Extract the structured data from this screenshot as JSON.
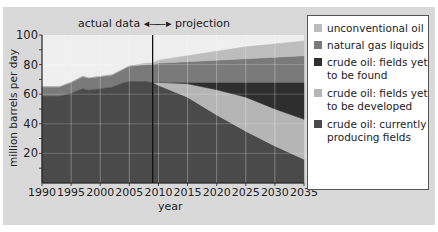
{
  "header": {
    "actual_label": "actual data",
    "projection_label": "projection"
  },
  "axes": {
    "ylabel": "million barrels per day",
    "xlabel": "year",
    "yticks": [
      "20",
      "40",
      "60",
      "80",
      "100"
    ],
    "xticks": [
      "1990",
      "1995",
      "2000",
      "2005",
      "2010",
      "2015",
      "2020",
      "2025",
      "2030",
      "2035"
    ]
  },
  "legend": {
    "items": [
      {
        "label1": "unconventional oil",
        "label2": "",
        "color": "#bdbdbd"
      },
      {
        "label1": "natural gas liquids",
        "label2": "",
        "color": "#7a7a7a"
      },
      {
        "label1": "crude oil: fields yet",
        "label2": "to be found",
        "color": "#2e2e2e"
      },
      {
        "label1": "crude oil: fields yet",
        "label2": "to be developed",
        "color": "#b5b5b5"
      },
      {
        "label1": "crude oil: currently",
        "label2": "producing fields",
        "color": "#4a4a4a"
      }
    ]
  },
  "chart_data": {
    "type": "area",
    "stacked": true,
    "title": "",
    "xlabel": "year",
    "ylabel": "million barrels per day",
    "xlim": [
      1990,
      2035
    ],
    "ylim": [
      0,
      100
    ],
    "grid": true,
    "divider_year": 2009,
    "annotations": [
      "actual data",
      "projection"
    ],
    "legend_position": "right",
    "x": [
      1990,
      1993,
      1995,
      1997,
      1998,
      2000,
      2002,
      2004,
      2005,
      2008,
      2009,
      2010,
      2015,
      2020,
      2025,
      2030,
      2035
    ],
    "series": [
      {
        "name": "crude oil: currently producing fields",
        "color": "#4a4a4a",
        "values": [
          59,
          59,
          61,
          64,
          63,
          64,
          65,
          68,
          69,
          69,
          68,
          66,
          58,
          46,
          35,
          25,
          16
        ]
      },
      {
        "name": "crude oil: fields yet to be developed",
        "color": "#b5b5b5",
        "values": [
          0,
          0,
          0,
          0,
          0,
          0,
          0,
          0,
          0,
          0,
          0,
          2,
          9,
          17,
          23,
          25,
          27
        ]
      },
      {
        "name": "crude oil: fields yet to be found",
        "color": "#2e2e2e",
        "values": [
          0,
          0,
          0,
          0,
          0,
          0,
          0,
          0,
          0,
          0,
          0,
          0,
          1,
          5,
          10,
          18,
          25
        ]
      },
      {
        "name": "natural gas liquids",
        "color": "#7a7a7a",
        "values": [
          6,
          6,
          7,
          8,
          8,
          8,
          8,
          9,
          10,
          11,
          12,
          13,
          14,
          15,
          16,
          17,
          18
        ]
      },
      {
        "name": "unconventional oil",
        "color": "#bdbdbd",
        "values": [
          0,
          0,
          0,
          0,
          0,
          0,
          0,
          0,
          0,
          1,
          1,
          2,
          4,
          6,
          8,
          9,
          10
        ]
      }
    ]
  }
}
